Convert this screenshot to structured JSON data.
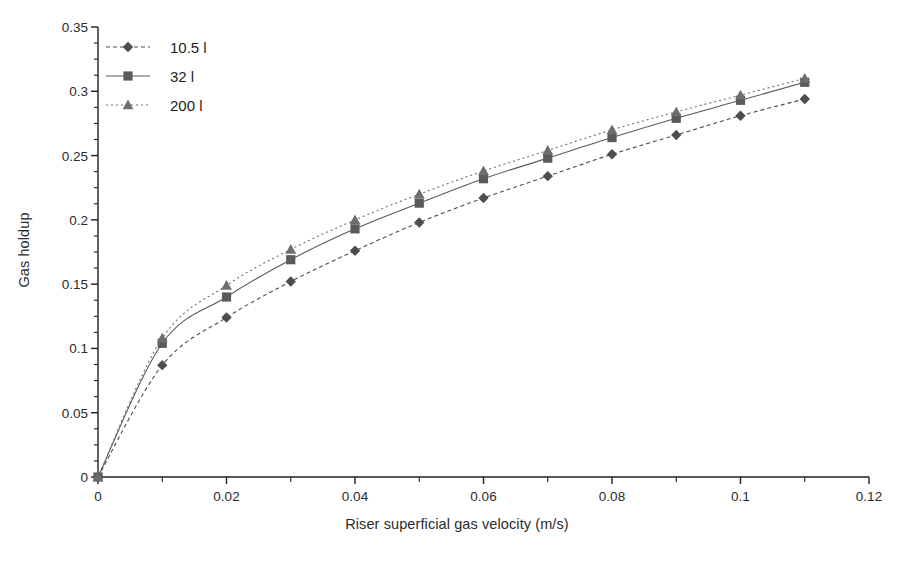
{
  "chart_data": {
    "type": "line",
    "title": "",
    "xlabel": "Riser superficial gas velocity (m/s)",
    "ylabel": "Gas holdup",
    "xlim": [
      0,
      0.12
    ],
    "ylim": [
      0,
      0.35
    ],
    "xticks": [
      "0",
      "0.02",
      "0.04",
      "0.06",
      "0.08",
      "0.1",
      "0.12"
    ],
    "xtick_values": [
      0,
      0.02,
      0.04,
      0.06,
      0.08,
      0.1,
      0.12
    ],
    "yticks": [
      "0",
      "0.05",
      "0.1",
      "0.15",
      "0.2",
      "0.25",
      "0.3",
      "0.35"
    ],
    "ytick_values": [
      0,
      0.05,
      0.1,
      0.15,
      0.2,
      0.25,
      0.3,
      0.35
    ],
    "minor_xtick_interval": 0.01,
    "minor_ytick_interval": 0.0125,
    "grid": false,
    "legend_position": "top-left",
    "x": [
      0,
      0.01,
      0.02,
      0.03,
      0.04,
      0.05,
      0.06,
      0.07,
      0.08,
      0.09,
      0.1,
      0.11
    ],
    "series": [
      {
        "name": "10.5 l",
        "marker": "diamond",
        "color": "#4d4d4d",
        "line_style": "dashed",
        "values": [
          0,
          0.087,
          0.124,
          0.152,
          0.176,
          0.198,
          0.217,
          0.234,
          0.251,
          0.266,
          0.281,
          0.294
        ]
      },
      {
        "name": "32 l",
        "marker": "square",
        "color": "#5a5a5a",
        "line_style": "solid",
        "values": [
          0,
          0.104,
          0.14,
          0.169,
          0.193,
          0.213,
          0.232,
          0.248,
          0.264,
          0.279,
          0.293,
          0.307
        ]
      },
      {
        "name": "200 l",
        "marker": "triangle",
        "color": "#6e6e6e",
        "line_style": "dotted",
        "values": [
          0,
          0.108,
          0.149,
          0.177,
          0.2,
          0.22,
          0.238,
          0.254,
          0.27,
          0.284,
          0.297,
          0.31
        ]
      }
    ]
  },
  "colors": {
    "axis": "#231f20",
    "text": "#2b2b2b",
    "background": "#ffffff"
  }
}
